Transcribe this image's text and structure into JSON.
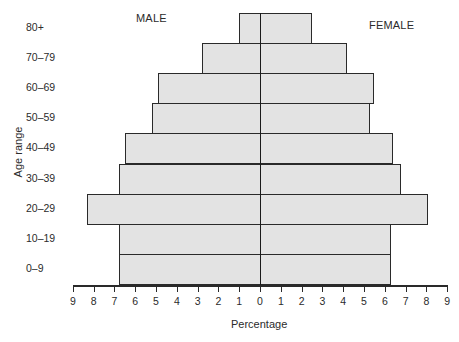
{
  "chart_data": {
    "type": "bar",
    "subtype": "population-pyramid",
    "title": "",
    "xlabel": "Percentage",
    "ylabel": "Age range",
    "categories": [
      "80+",
      "70–79",
      "60–69",
      "50–59",
      "40–49",
      "30–39",
      "20–29",
      "10–19",
      "0–9"
    ],
    "series": [
      {
        "name": "MALE",
        "side": "left",
        "values": [
          1.0,
          2.8,
          4.9,
          5.2,
          6.5,
          6.8,
          8.3,
          6.8,
          6.8
        ]
      },
      {
        "name": "FEMALE",
        "side": "right",
        "values": [
          2.5,
          4.2,
          5.5,
          5.3,
          6.4,
          6.8,
          8.1,
          6.3,
          6.3
        ]
      }
    ],
    "xticks": [
      9,
      8,
      7,
      6,
      5,
      4,
      3,
      2,
      1,
      0,
      1,
      2,
      3,
      4,
      5,
      6,
      7,
      8,
      9
    ],
    "xlim": [
      -9,
      9
    ],
    "grid": false,
    "legend": "side titles: MALE (left), FEMALE (right)",
    "colors": {
      "bar_fill": "#e3e3e3",
      "bar_edge": "#2a2a2a"
    }
  },
  "labels": {
    "male": "MALE",
    "female": "FEMALE",
    "xlabel": "Percentage",
    "ylabel": "Age range"
  }
}
